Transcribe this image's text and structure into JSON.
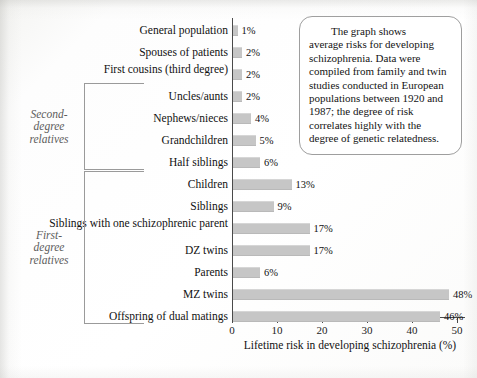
{
  "chart_data": {
    "type": "bar",
    "orientation": "horizontal",
    "title": "",
    "xlabel": "Lifetime risk in developing schizophrenia (%)",
    "ylabel": "",
    "xlim": [
      0,
      52
    ],
    "xticks": [
      "0",
      "10",
      "20",
      "30",
      "40",
      "50"
    ],
    "xtick_values": [
      0,
      10,
      20,
      30,
      40,
      50
    ],
    "grid": false,
    "legend": "none",
    "bar_color": "#c6c6c6",
    "categories": [
      "General population",
      "Spouses of patients",
      "First cousins (third degree)",
      "Uncles/aunts",
      "Nephews/nieces",
      "Grandchildren",
      "Half siblings",
      "Children",
      "Siblings",
      "Siblings with one schizophrenic parent",
      "DZ twins",
      "Parents",
      "MZ twins",
      "Offspring of dual matings"
    ],
    "values": [
      1,
      2,
      2,
      2,
      4,
      5,
      6,
      13,
      9,
      17,
      17,
      6,
      48,
      46
    ],
    "value_labels": [
      "1%",
      "2%",
      "2%",
      "2%",
      "4%",
      "5%",
      "6%",
      "13%",
      "9%",
      "17%",
      "17%",
      "6%",
      "48%",
      "46%"
    ]
  },
  "groups": [
    {
      "label": "Second-\ndegree\nrelatives",
      "first_index": 3,
      "last_index": 6
    },
    {
      "label": "First-\ndegree\nrelatives",
      "first_index": 7,
      "last_index": 13
    }
  ],
  "caption": {
    "line1": "The graph shows",
    "line2": "average risks for developing schizophrenia. Data were compiled from family and twin studies conducted in European populations between 1920 and 1987; the degree of risk correlates highly with the degree of genetic relatedness."
  }
}
